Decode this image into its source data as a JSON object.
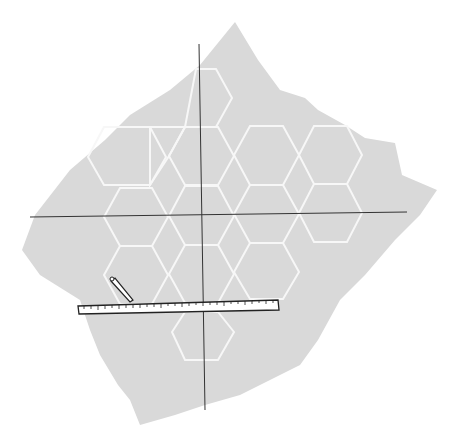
{
  "illustration": {
    "subject": "sheet of paper with hexagon pattern, coordinate axes, ruler and pencil",
    "colors": {
      "background": "#ffffff",
      "paper": "#d9d9d9",
      "hex_lines": "#ffffff",
      "axes": "#333333",
      "ruler_fill": "#ffffff",
      "ruler_stroke": "#222222"
    },
    "elements": [
      "paper-sheet",
      "hexagon-grid",
      "vertical-axis",
      "horizontal-axis",
      "ruler",
      "pencil"
    ]
  }
}
